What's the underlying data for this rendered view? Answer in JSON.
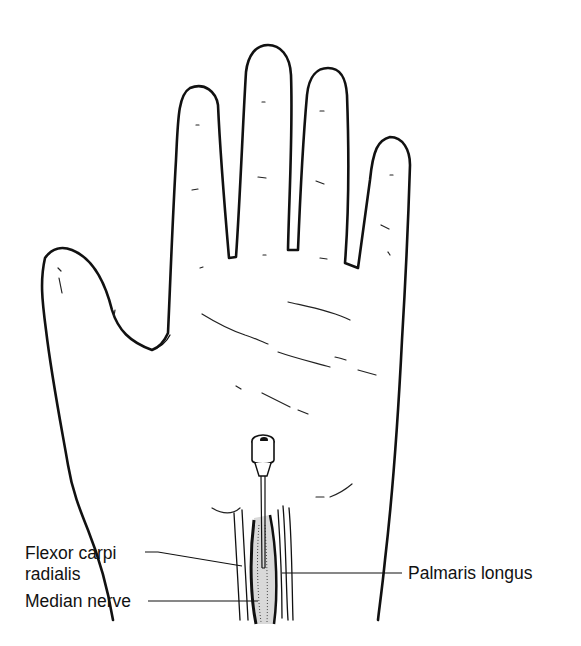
{
  "figure": {
    "labels": {
      "flexor_line1": "Flexor carpi",
      "flexor_line2": "radialis",
      "median": "Median nerve",
      "palmaris": "Palmaris longus"
    },
    "colors": {
      "ink": "#111111",
      "background": "#ffffff"
    }
  }
}
